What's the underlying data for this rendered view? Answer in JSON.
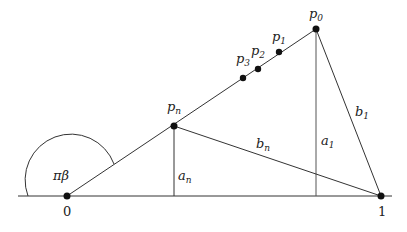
{
  "diagram": {
    "angle_label": "πβ",
    "axis_labels": {
      "origin": "0",
      "unit": "1"
    },
    "points": [
      {
        "id": "p0",
        "base": "p",
        "sub": "0"
      },
      {
        "id": "p1",
        "base": "p",
        "sub": "1"
      },
      {
        "id": "p2",
        "base": "p",
        "sub": "2"
      },
      {
        "id": "p3",
        "base": "p",
        "sub": "3"
      },
      {
        "id": "pn",
        "base": "p",
        "sub": "n"
      }
    ],
    "segments": [
      {
        "id": "a1",
        "base": "a",
        "sub": "1"
      },
      {
        "id": "b1",
        "base": "b",
        "sub": "1"
      },
      {
        "id": "an",
        "base": "a",
        "sub": "n"
      },
      {
        "id": "bn",
        "base": "b",
        "sub": "n"
      }
    ]
  }
}
